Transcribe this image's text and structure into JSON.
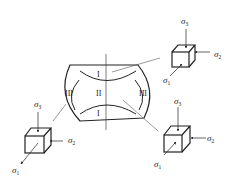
{
  "diagram": {
    "type": "stress-state zones in an upset/compressed billet",
    "zones": [
      {
        "id": "I-top",
        "label": "I"
      },
      {
        "id": "I-bottom",
        "label": "I"
      },
      {
        "id": "II-center",
        "label": "II"
      },
      {
        "id": "III-left",
        "label": "III"
      },
      {
        "id": "III-right",
        "label": "III"
      }
    ],
    "stress_elements": [
      {
        "id": "top-right",
        "labels": {
          "s3": "σ",
          "s3_sub": "3",
          "s2": "σ",
          "s2_sub": "2",
          "s1": "σ",
          "s1_sub": "1"
        },
        "zone": "I"
      },
      {
        "id": "bottom-left",
        "labels": {
          "s3": "σ",
          "s3_sub": "3",
          "s2": "σ",
          "s2_sub": "2",
          "s1": "σ",
          "s1_sub": "1"
        },
        "zone": "III"
      },
      {
        "id": "bottom-right",
        "labels": {
          "s3": "σ",
          "s3_sub": "3",
          "s2": "σ",
          "s2_sub": "2",
          "s1": "σ",
          "s1_sub": "1"
        },
        "zone": "II"
      }
    ],
    "colors": {
      "line": "#222222",
      "leader": "#555555",
      "background": "#ffffff"
    }
  }
}
